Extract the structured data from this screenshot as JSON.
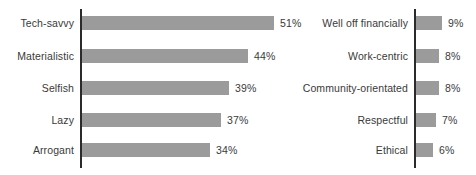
{
  "chart_data": [
    {
      "type": "bar",
      "orientation": "horizontal",
      "panel": "left",
      "title": "",
      "xlabel": "",
      "ylabel": "",
      "xlim": [
        0,
        51
      ],
      "grid": false,
      "legend": false,
      "value_suffix": "%",
      "bar_color": "#9b9b9b",
      "axis_color": "#2b2b2b",
      "text_color": "#3a3a3a",
      "categories": [
        "Tech-savvy",
        "Materialistic",
        "Selfish",
        "Lazy",
        "Arrogant"
      ],
      "values": [
        51,
        44,
        39,
        37,
        34
      ],
      "value_labels": [
        "51%",
        "44%",
        "39%",
        "37%",
        "34%"
      ]
    },
    {
      "type": "bar",
      "orientation": "horizontal",
      "panel": "right",
      "title": "",
      "xlabel": "",
      "ylabel": "",
      "xlim": [
        0,
        9
      ],
      "grid": false,
      "legend": false,
      "value_suffix": "%",
      "bar_color": "#9b9b9b",
      "axis_color": "#2b2b2b",
      "text_color": "#3a3a3a",
      "categories": [
        "Well off financially",
        "Work-centric",
        "Community-orientated",
        "Respectful",
        "Ethical"
      ],
      "values": [
        9,
        8,
        8,
        7,
        6
      ],
      "value_labels": [
        "9%",
        "8%",
        "8%",
        "7%",
        "6%"
      ]
    }
  ],
  "left_chart": {
    "rows": [
      {
        "label": "Tech-savvy",
        "value_label": "51%"
      },
      {
        "label": "Materialistic",
        "value_label": "44%"
      },
      {
        "label": "Selfish",
        "value_label": "39%"
      },
      {
        "label": "Lazy",
        "value_label": "37%"
      },
      {
        "label": "Arrogant",
        "value_label": "34%"
      }
    ]
  },
  "right_chart": {
    "rows": [
      {
        "label": "Well off financially",
        "value_label": "9%"
      },
      {
        "label": "Work-centric",
        "value_label": "8%"
      },
      {
        "label": "Community-orientated",
        "value_label": "8%"
      },
      {
        "label": "Respectful",
        "value_label": "7%"
      },
      {
        "label": "Ethical",
        "value_label": "6%"
      }
    ]
  }
}
